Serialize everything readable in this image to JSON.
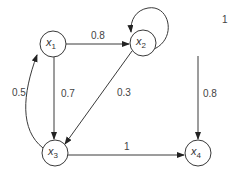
{
  "diagram": {
    "type": "directed-graph",
    "nodes": [
      {
        "id": "x1",
        "name": "x",
        "sub": "1"
      },
      {
        "id": "x2",
        "name": "x",
        "sub": "2"
      },
      {
        "id": "x3",
        "name": "x",
        "sub": "3"
      },
      {
        "id": "x4",
        "name": "x",
        "sub": "4"
      }
    ],
    "edges": [
      {
        "from": "x1",
        "to": "x2",
        "weight": "0.8"
      },
      {
        "from": "x2",
        "to": "x2",
        "weight": "1"
      },
      {
        "from": "x1",
        "to": "x3",
        "weight": "0.7"
      },
      {
        "from": "x2",
        "to": "x3",
        "weight": "0.3"
      },
      {
        "from": "x2",
        "to": "x4",
        "weight": "0.8"
      },
      {
        "from": "x3",
        "to": "x1",
        "weight": "0.5"
      },
      {
        "from": "x3",
        "to": "x4",
        "weight": "1"
      }
    ]
  }
}
